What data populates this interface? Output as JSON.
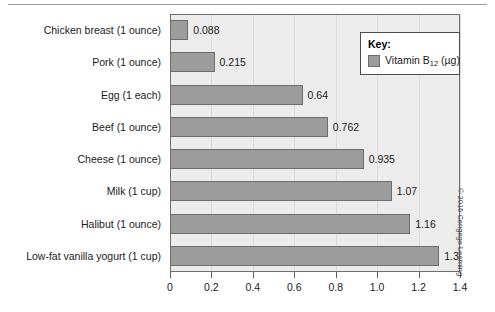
{
  "chart_data": {
    "type": "bar",
    "orientation": "horizontal",
    "title": "",
    "xlabel": "",
    "ylabel": "",
    "xlim": [
      0,
      1.4
    ],
    "xticks": [
      "0",
      "0.2",
      "0.4",
      "0.6",
      "0.8",
      "1.0",
      "1.2",
      "1.4"
    ],
    "xtick_values": [
      0,
      0.2,
      0.4,
      0.6,
      0.8,
      1.0,
      1.2,
      1.4
    ],
    "grid": true,
    "legend_position": "top-right",
    "categories": [
      "Chicken breast (1 ounce)",
      "Pork (1 ounce)",
      "Egg (1 each)",
      "Beef (1 ounce)",
      "Cheese (1 ounce)",
      "Milk (1 cup)",
      "Halibut (1 ounce)",
      "Low-fat vanilla yogurt (1 cup)"
    ],
    "values": [
      0.088,
      0.215,
      0.64,
      0.762,
      0.935,
      1.07,
      1.16,
      1.3
    ],
    "value_labels": [
      "0.088",
      "0.215",
      "0.64",
      "0.762",
      "0.935",
      "1.07",
      "1.16",
      "1.3"
    ],
    "series": [
      {
        "name": "Vitamin B12 (µg)",
        "values": [
          0.088,
          0.215,
          0.64,
          0.762,
          0.935,
          1.07,
          1.16,
          1.3
        ]
      }
    ],
    "colors": {
      "bar_fill": "#9c9c9c",
      "bar_border": "#6d6d6d",
      "plot_background": "#ececec",
      "plot_border": "#6e6e6e",
      "gridline": "#dcdcdc",
      "text": "#1b1b1b"
    }
  },
  "legend": {
    "title": "Key:",
    "entry_prefix": "Vitamin B",
    "entry_subscript": "12",
    "entry_suffix": " (µg)",
    "swatch_color": "#9c9c9c"
  },
  "credit": {
    "text": "© 2016 Cengage Learning"
  }
}
